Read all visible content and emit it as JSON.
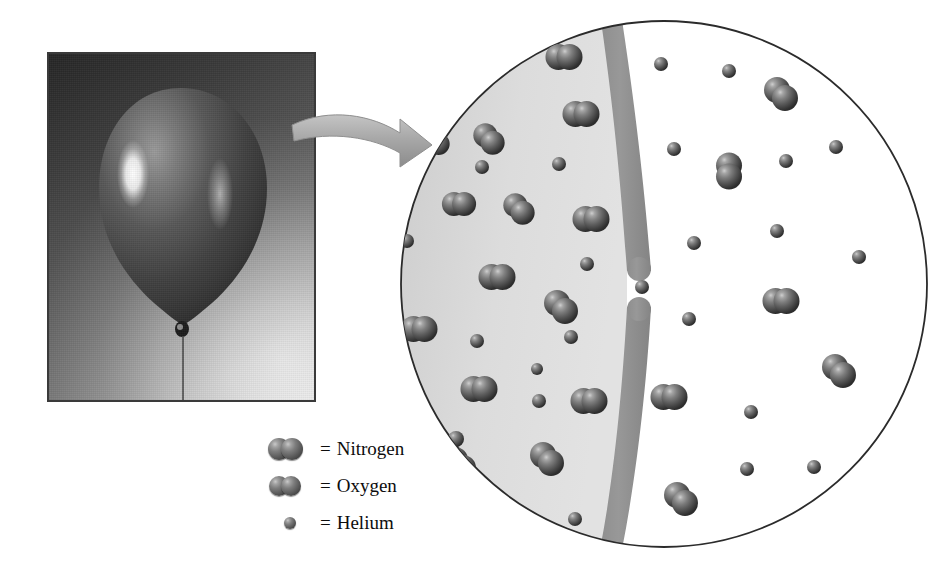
{
  "figure": {
    "kind": "science-illustration",
    "panels": [
      "balloon-photograph",
      "magnified-molecular-view"
    ]
  },
  "legend": {
    "equals": "=",
    "items": [
      {
        "label": "Nitrogen",
        "icon": "nitrogen-icon",
        "shape": "diatomic-pair",
        "size": "large"
      },
      {
        "label": "Oxygen",
        "icon": "oxygen-icon",
        "shape": "diatomic-pair",
        "size": "large"
      },
      {
        "label": "Helium",
        "icon": "helium-icon",
        "shape": "single-sphere",
        "size": "small"
      }
    ]
  },
  "colors": {
    "inside_region": "#dcdcdc",
    "outside_region": "#ffffff",
    "balloon_wall": "#8f8f8f",
    "atom_dark": "#2d2d2d",
    "atom_light": "#cfcfcf",
    "outline": "#2b2b2b",
    "arrow": "#a8a8a8",
    "text": "#0d0d0d"
  },
  "magnified_view": {
    "center": [
      265,
      265
    ],
    "radius": 263,
    "wall": {
      "description": "balloon membrane, vertical curved band with a pore gap",
      "gap_y_range": [
        252,
        288
      ]
    },
    "molecules": {
      "inside": [
        {
          "type": "nitrogen",
          "x": 90,
          "y": 120,
          "r": 12,
          "orient": "diagonal"
        },
        {
          "type": "nitrogen",
          "x": 60,
          "y": 185,
          "r": 12,
          "orient": "horizontal"
        },
        {
          "type": "nitrogen",
          "x": 120,
          "y": 190,
          "r": 12,
          "orient": "diagonal"
        },
        {
          "type": "oxygen",
          "x": 165,
          "y": 38,
          "r": 13,
          "orient": "horizontal"
        },
        {
          "type": "oxygen",
          "x": 182,
          "y": 95,
          "r": 13,
          "orient": "horizontal"
        },
        {
          "type": "oxygen",
          "x": 192,
          "y": 200,
          "r": 13,
          "orient": "horizontal"
        },
        {
          "type": "nitrogen",
          "x": 35,
          "y": 125,
          "r": 11,
          "orient": "horizontal"
        },
        {
          "type": "nitrogen",
          "x": 98,
          "y": 258,
          "r": 13,
          "orient": "horizontal"
        },
        {
          "type": "oxygen",
          "x": 162,
          "y": 288,
          "r": 13,
          "orient": "diagonal"
        },
        {
          "type": "nitrogen",
          "x": 20,
          "y": 310,
          "r": 13,
          "orient": "horizontal"
        },
        {
          "type": "nitrogen",
          "x": 80,
          "y": 370,
          "r": 13,
          "orient": "horizontal"
        },
        {
          "type": "oxygen",
          "x": 190,
          "y": 382,
          "r": 13,
          "orient": "horizontal"
        },
        {
          "type": "nitrogen",
          "x": 60,
          "y": 445,
          "r": 13,
          "orient": "diagonal"
        },
        {
          "type": "nitrogen",
          "x": 148,
          "y": 440,
          "r": 13,
          "orient": "diagonal"
        },
        {
          "type": "nitrogen",
          "x": 150,
          "y": 175,
          "r": 0,
          "orient": "skip"
        },
        {
          "type": "helium",
          "x": 83,
          "y": 148,
          "r": 7
        },
        {
          "type": "helium",
          "x": 160,
          "y": 145,
          "r": 7
        },
        {
          "type": "helium",
          "x": 8,
          "y": 222,
          "r": 7
        },
        {
          "type": "helium",
          "x": 188,
          "y": 245,
          "r": 7
        },
        {
          "type": "helium",
          "x": 78,
          "y": 322,
          "r": 7
        },
        {
          "type": "helium",
          "x": 140,
          "y": 382,
          "r": 7
        },
        {
          "type": "helium",
          "x": 138,
          "y": 350,
          "r": 6
        },
        {
          "type": "helium",
          "x": 176,
          "y": 500,
          "r": 7
        },
        {
          "type": "helium",
          "x": 57,
          "y": 420,
          "r": 8
        }
      ],
      "escaping": [
        {
          "type": "helium",
          "x": 243,
          "y": 268,
          "r": 7
        }
      ],
      "outside": [
        {
          "type": "helium",
          "x": 330,
          "y": 52,
          "r": 7
        },
        {
          "type": "helium",
          "x": 262,
          "y": 45,
          "r": 7
        },
        {
          "type": "helium",
          "x": 275,
          "y": 130,
          "r": 7
        },
        {
          "type": "helium",
          "x": 387,
          "y": 142,
          "r": 7
        },
        {
          "type": "helium",
          "x": 437,
          "y": 128,
          "r": 7
        },
        {
          "type": "helium",
          "x": 295,
          "y": 224,
          "r": 7
        },
        {
          "type": "helium",
          "x": 378,
          "y": 212,
          "r": 7
        },
        {
          "type": "helium",
          "x": 460,
          "y": 238,
          "r": 7
        },
        {
          "type": "helium",
          "x": 290,
          "y": 300,
          "r": 7
        },
        {
          "type": "helium",
          "x": 352,
          "y": 393,
          "r": 7
        },
        {
          "type": "helium",
          "x": 348,
          "y": 450,
          "r": 7
        },
        {
          "type": "helium",
          "x": 415,
          "y": 448,
          "r": 7
        },
        {
          "type": "helium",
          "x": 172,
          "y": 318,
          "r": 7
        },
        {
          "type": "oxygen",
          "x": 382,
          "y": 75,
          "r": 13,
          "orient": "diagonal"
        },
        {
          "type": "nitrogen",
          "x": 330,
          "y": 152,
          "r": 13,
          "orient": "vertical"
        },
        {
          "type": "nitrogen",
          "x": 382,
          "y": 282,
          "r": 13,
          "orient": "horizontal"
        },
        {
          "type": "nitrogen",
          "x": 440,
          "y": 352,
          "r": 13,
          "orient": "diagonal"
        },
        {
          "type": "nitrogen",
          "x": 270,
          "y": 378,
          "r": 13,
          "orient": "horizontal"
        },
        {
          "type": "oxygen",
          "x": 282,
          "y": 480,
          "r": 13,
          "orient": "diagonal"
        },
        {
          "type": "nitrogen",
          "x": 185,
          "y": 305,
          "r": 0,
          "orient": "skip"
        }
      ]
    }
  }
}
